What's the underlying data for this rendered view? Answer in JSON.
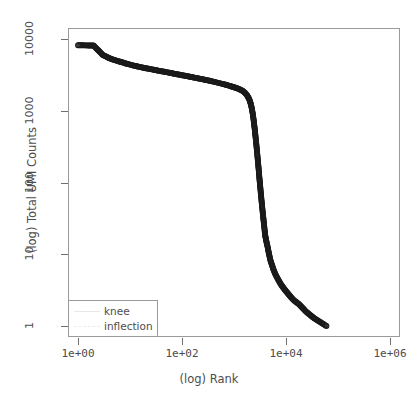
{
  "chart_data": {
    "type": "scatter",
    "title": "",
    "subtitle": "",
    "xlabel": "(log) Rank",
    "ylabel": "(log) Total UMI Counts",
    "xscale": "log",
    "yscale": "log",
    "xlim": [
      1,
      1000000
    ],
    "ylim": [
      1,
      10000
    ],
    "xticks": [
      1,
      100,
      10000,
      1000000
    ],
    "xtick_labels": [
      "1e+00",
      "1e+02",
      "1e+04",
      "1e+06"
    ],
    "yticks": [
      1,
      10,
      100,
      1000,
      10000
    ],
    "ytick_labels": [
      "1",
      "10",
      "100",
      "1000",
      "10000"
    ],
    "grid": false,
    "marker": "open-circle",
    "marker_color": "#1a1a1a",
    "legend_position": "bottom-left",
    "legend": [
      {
        "label": "knee",
        "style": "solid",
        "color": "#e8e8e8"
      },
      {
        "label": "inflection",
        "style": "dashed",
        "color": "#ececec"
      }
    ],
    "series": [
      {
        "name": "Total UMI Counts",
        "points": [
          [
            1,
            8200
          ],
          [
            2,
            8100
          ],
          [
            3,
            6000
          ],
          [
            4,
            5400
          ],
          [
            5,
            5100
          ],
          [
            6,
            4900
          ],
          [
            7,
            4750
          ],
          [
            8,
            4600
          ],
          [
            9,
            4500
          ],
          [
            10,
            4400
          ],
          [
            12,
            4250
          ],
          [
            14,
            4150
          ],
          [
            16,
            4050
          ],
          [
            18,
            3980
          ],
          [
            20,
            3920
          ],
          [
            25,
            3800
          ],
          [
            30,
            3700
          ],
          [
            35,
            3620
          ],
          [
            40,
            3560
          ],
          [
            50,
            3450
          ],
          [
            60,
            3360
          ],
          [
            70,
            3290
          ],
          [
            80,
            3230
          ],
          [
            90,
            3180
          ],
          [
            100,
            3130
          ],
          [
            130,
            3020
          ],
          [
            160,
            2930
          ],
          [
            200,
            2840
          ],
          [
            250,
            2750
          ],
          [
            300,
            2670
          ],
          [
            400,
            2550
          ],
          [
            500,
            2450
          ],
          [
            600,
            2370
          ],
          [
            700,
            2300
          ],
          [
            800,
            2240
          ],
          [
            900,
            2180
          ],
          [
            1000,
            2130
          ],
          [
            1150,
            2060
          ],
          [
            1300,
            1980
          ],
          [
            1450,
            1900
          ],
          [
            1600,
            1800
          ],
          [
            1750,
            1680
          ],
          [
            1900,
            1520
          ],
          [
            2000,
            1400
          ],
          [
            2100,
            1250
          ],
          [
            2200,
            1080
          ],
          [
            2300,
            900
          ],
          [
            2400,
            720
          ],
          [
            2500,
            560
          ],
          [
            2600,
            430
          ],
          [
            2700,
            330
          ],
          [
            2800,
            250
          ],
          [
            2900,
            190
          ],
          [
            3000,
            145
          ],
          [
            3100,
            110
          ],
          [
            3200,
            86
          ],
          [
            3300,
            68
          ],
          [
            3400,
            54
          ],
          [
            3500,
            44
          ],
          [
            3600,
            36
          ],
          [
            3700,
            30
          ],
          [
            3800,
            25
          ],
          [
            3900,
            21
          ],
          [
            4000,
            18
          ],
          [
            4200,
            15
          ],
          [
            4400,
            13
          ],
          [
            4600,
            11
          ],
          [
            4800,
            9.5
          ],
          [
            5000,
            8.3
          ],
          [
            5400,
            7.0
          ],
          [
            5800,
            6.0
          ],
          [
            6300,
            5.2
          ],
          [
            7000,
            4.5
          ],
          [
            8000,
            3.8
          ],
          [
            9500,
            3.2
          ],
          [
            11500,
            2.7
          ],
          [
            14000,
            2.3
          ],
          [
            18000,
            2.0
          ],
          [
            24000,
            1.6
          ],
          [
            34000,
            1.3
          ],
          [
            60000,
            1.0
          ]
        ]
      }
    ],
    "annotations": []
  }
}
